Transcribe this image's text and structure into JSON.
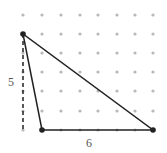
{
  "diagram": {
    "type": "dot-grid-triangle",
    "grid": {
      "columns": [
        23,
        42,
        61,
        80,
        98,
        117,
        135,
        153
      ],
      "rows": [
        15,
        34,
        53,
        72,
        91,
        111,
        130
      ],
      "dot_color": "#b8b8b8"
    },
    "triangle": {
      "vertices": [
        [
          23,
          34
        ],
        [
          42,
          130
        ],
        [
          153,
          130
        ]
      ],
      "stroke": "#222222"
    },
    "height_line": {
      "from": [
        23,
        34
      ],
      "to": [
        23,
        130
      ]
    },
    "labels": {
      "height": "5",
      "base": "6"
    }
  }
}
